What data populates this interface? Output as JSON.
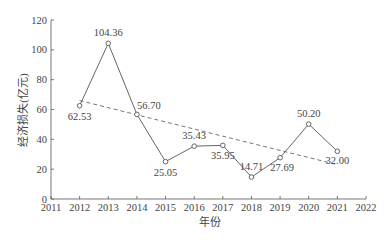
{
  "chart_data": {
    "type": "line",
    "title": "",
    "xlabel": "年份",
    "ylabel": "经济损失(亿元)",
    "xlim": [
      2011,
      2022
    ],
    "ylim": [
      0,
      120
    ],
    "x_ticks": [
      "2011",
      "2012",
      "2013",
      "2014",
      "2015",
      "2016",
      "2017",
      "2018",
      "2019",
      "2020",
      "2021",
      "2022"
    ],
    "y_ticks": [
      "0",
      "20",
      "40",
      "60",
      "80",
      "100",
      "120"
    ],
    "grid": false,
    "legend": null,
    "series": [
      {
        "name": "经济损失",
        "style": "solid line with open circle markers",
        "x": [
          2012,
          2013,
          2014,
          2015,
          2016,
          2017,
          2018,
          2019,
          2020,
          2021
        ],
        "values": [
          62.53,
          104.36,
          56.7,
          25.05,
          35.43,
          35.95,
          14.71,
          27.69,
          50.2,
          32.0
        ],
        "labels": [
          "62.53",
          "104.36",
          "56.70",
          "25.05",
          "35.43",
          "35.95",
          "14.71",
          "27.69",
          "50.20",
          "32.00"
        ]
      },
      {
        "name": "趋势线",
        "style": "dashed linear trend",
        "x": [
          2012,
          2021
        ],
        "values": [
          66,
          23
        ]
      }
    ]
  }
}
